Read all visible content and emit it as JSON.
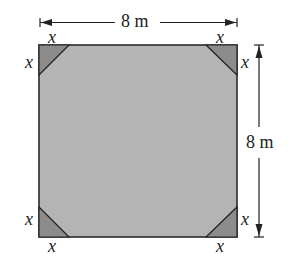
{
  "diagram": {
    "width_label": "8 m",
    "height_label": "8 m",
    "corner_labels": {
      "top_left_top": "x",
      "top_left_side": "x",
      "top_right_top": "x",
      "top_right_side": "x",
      "bottom_left_side": "x",
      "bottom_left_bottom": "x",
      "bottom_right_side": "x",
      "bottom_right_bottom": "x"
    },
    "colors": {
      "square_fill": "#b4b4b4",
      "corner_fill": "#8c8c8c",
      "stroke": "#222222"
    }
  }
}
